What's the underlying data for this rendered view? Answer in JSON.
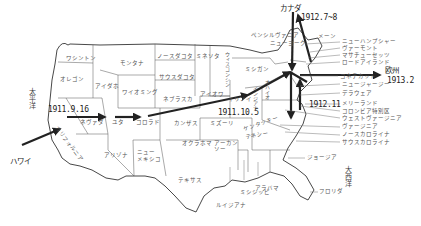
{
  "map": {
    "title": "",
    "oceans": {
      "pacific": "太平洋",
      "atlantic": "大西洋"
    },
    "places": {
      "hawaii": "ハワイ",
      "canada": "カナダ",
      "europe": "欧州"
    },
    "dates": {
      "d1": "1911.9.16",
      "d2": "1911.10.5",
      "d3": "1912.7~8",
      "d4": "1912.11",
      "d5": "1913.2"
    },
    "states": {
      "washington": "ワシントン",
      "oregon": "オレゴン",
      "california": "カリフォルニア",
      "idaho": "アイダホ",
      "nevada": "ネヴァダ",
      "montana": "モンタナ",
      "wyoming": "ワイオミング",
      "utah": "ユタ",
      "arizona": "アリゾナ",
      "colorado": "コロラド",
      "new_mexico_1": "ニュー",
      "new_mexico_2": "メキシコ",
      "north_dakota": "ノースダコタ",
      "south_dakota": "サウスダコタ",
      "nebraska": "ネブラスカ",
      "kansas": "カンザス",
      "oklahoma": "オクラホマ",
      "texas": "テキサス",
      "minnesota": "ミネソタ",
      "iowa": "アイオワ",
      "missouri": "ミズーリ",
      "arkansas_1": "アーカン",
      "arkansas_2": "ソー",
      "louisiana": "ルイジアナ",
      "wisconsin": "ウィスコンシン",
      "illinois": "イリノイ",
      "michigan": "ミシガン",
      "indiana": "インジアナ",
      "ohio": "オハイオ",
      "kentucky": "ケンタッキー",
      "tennessee": "テネシー",
      "mississippi": "ミシシッピ",
      "alabama": "アラバマ",
      "georgia": "ジョージア",
      "florida": "フロリダ",
      "pennsylvania": "ペンシルヴァニア",
      "new_york": "ニューヨーク",
      "maine": "メーン",
      "new_hampshire": "ニューハンプシャー",
      "vermont": "ヴァーモント",
      "massachusetts": "マサチューセッツ",
      "rhode_island": "ロードアイランド",
      "connecticut": "コネチカット",
      "new_jersey": "ニュージャージー",
      "delaware": "デラウェア",
      "maryland": "メリーランド",
      "dc": "コロンビア特別区",
      "west_virginia": "ウェストヴァージニア",
      "virginia": "ヴァージニア",
      "north_carolina": "ノースカロライナ",
      "south_carolina": "サウスカロライナ"
    },
    "colors": {
      "route": "#222222",
      "border": "#333333",
      "dotted": "#666666",
      "text": "#555555"
    }
  }
}
